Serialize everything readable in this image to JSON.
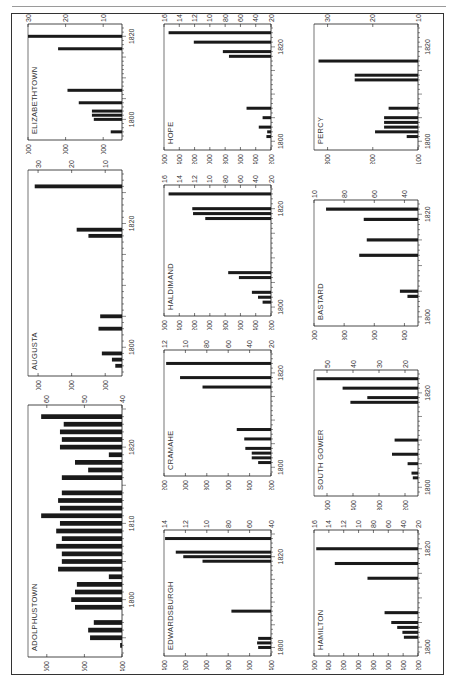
{
  "page": {
    "orientation": "rotated-90",
    "ink_color": "#1a1a1a",
    "paper_color": "#ffffff",
    "frame_color": "#333333"
  },
  "chart_data": [
    {
      "type": "bar",
      "title": "ELIZABETHTOWN",
      "xlabel": "",
      "ylabel": "",
      "x_ticks": [
        "1800",
        "1820"
      ],
      "x_range": [
        1796,
        1822
      ],
      "ylim": [
        500,
        3000
      ],
      "y_ticks": [
        1000,
        2000,
        3000
      ],
      "x": [
        1797,
        1800,
        1801,
        1802,
        1804,
        1807,
        1817,
        1820
      ],
      "values": [
        800,
        1250,
        1300,
        1300,
        1650,
        1950,
        2200,
        3000
      ],
      "panel": {
        "left": 14,
        "top": 14,
        "width": 132,
        "height": 140
      }
    },
    {
      "type": "bar",
      "title": "AUGUSTA",
      "xlabel": "",
      "ylabel": "",
      "x_ticks": [
        "1800",
        "1820"
      ],
      "x_range": [
        1796,
        1828
      ],
      "ylim": [
        500,
        3300
      ],
      "y_ticks": [
        1000,
        2000,
        3000
      ],
      "x": [
        1797,
        1798,
        1799,
        1803,
        1805,
        1818,
        1819,
        1826
      ],
      "values": [
        700,
        800,
        1100,
        1200,
        1150,
        1500,
        1850,
        3100
      ],
      "panel": {
        "left": 14,
        "top": 160,
        "width": 132,
        "height": 230
      }
    },
    {
      "type": "bar",
      "title": "ADOLPHUSTOWN",
      "xlabel": "",
      "ylabel": "",
      "x_ticks": [
        "1800",
        "1810",
        "1820"
      ],
      "x_range": [
        1793,
        1825
      ],
      "ylim": [
        400,
        650
      ],
      "y_ticks": [
        400,
        500,
        600
      ],
      "x": [
        1794,
        1795,
        1796,
        1797,
        1799,
        1800,
        1801,
        1802,
        1803,
        1804,
        1805,
        1806,
        1807,
        1808,
        1809,
        1810,
        1811,
        1812,
        1813,
        1814,
        1816,
        1817,
        1818,
        1819,
        1820,
        1821,
        1822,
        1823,
        1824
      ],
      "values": [
        405,
        485,
        490,
        475,
        525,
        535,
        525,
        520,
        435,
        570,
        560,
        560,
        575,
        560,
        575,
        565,
        615,
        565,
        570,
        560,
        560,
        490,
        525,
        435,
        565,
        560,
        565,
        555,
        615
      ],
      "panel": {
        "left": 14,
        "top": 395,
        "width": 132,
        "height": 276
      }
    },
    {
      "type": "bar",
      "title": "HOPE",
      "xlabel": "",
      "ylabel": "",
      "x_ticks": [
        "1800",
        "1820"
      ],
      "x_range": [
        1799,
        1824
      ],
      "ylim": [
        200,
        1600
      ],
      "y_ticks": [
        200,
        400,
        600,
        800,
        1000,
        1200,
        1400,
        1600
      ],
      "x": [
        1801,
        1802,
        1803,
        1805,
        1807,
        1818,
        1819,
        1821,
        1823
      ],
      "values": [
        260,
        250,
        360,
        310,
        520,
        750,
        830,
        1210,
        1540
      ],
      "panel": {
        "left": 150,
        "top": 14,
        "width": 145,
        "height": 150
      }
    },
    {
      "type": "bar",
      "title": "HALDIMAND",
      "xlabel": "",
      "ylabel": "",
      "x_ticks": [
        "1800",
        "1820"
      ],
      "x_range": [
        1799,
        1824
      ],
      "ylim": [
        200,
        1600
      ],
      "y_ticks": [
        200,
        400,
        600,
        800,
        1000,
        1200,
        1400,
        1600
      ],
      "x": [
        1801,
        1802,
        1803,
        1806,
        1807,
        1818,
        1819,
        1820,
        1823
      ],
      "values": [
        310,
        370,
        450,
        620,
        760,
        1060,
        1220,
        1230,
        1540
      ],
      "panel": {
        "left": 150,
        "top": 175,
        "width": 145,
        "height": 155
      }
    },
    {
      "type": "bar",
      "title": "CRAMAHE",
      "xlabel": "",
      "ylabel": "",
      "x_ticks": [
        "1800",
        "1820"
      ],
      "x_range": [
        1799,
        1824
      ],
      "ylim": [
        200,
        1200
      ],
      "y_ticks": [
        200,
        400,
        600,
        800,
        1000,
        1200
      ],
      "x": [
        1801,
        1802,
        1803,
        1804,
        1806,
        1808,
        1817,
        1819,
        1822
      ],
      "values": [
        320,
        380,
        380,
        440,
        450,
        520,
        840,
        1050,
        1180
      ],
      "panel": {
        "left": 150,
        "top": 340,
        "width": 145,
        "height": 150
      }
    },
    {
      "type": "bar",
      "title": "EDWARDSBURGH",
      "xlabel": "",
      "ylabel": "",
      "x_ticks": [
        "1800",
        "1820"
      ],
      "x_range": [
        1799,
        1825
      ],
      "ylim": [
        400,
        1400
      ],
      "y_ticks": [
        400,
        600,
        800,
        1000,
        1200,
        1400
      ],
      "x": [
        1800,
        1801,
        1802,
        1808,
        1819,
        1820,
        1821,
        1824
      ],
      "values": [
        520,
        530,
        520,
        770,
        1040,
        1220,
        1290,
        1390
      ],
      "panel": {
        "left": 150,
        "top": 520,
        "width": 145,
        "height": 150
      }
    },
    {
      "type": "bar",
      "title": "PERCY",
      "xlabel": "",
      "ylabel": "",
      "x_ticks": [
        "1800",
        "1820"
      ],
      "x_range": [
        1799,
        1824
      ],
      "ylim": [
        100,
        330
      ],
      "y_ticks": [
        100,
        200,
        300
      ],
      "x": [
        1801,
        1802,
        1803,
        1804,
        1805,
        1807,
        1813,
        1814,
        1817
      ],
      "values": [
        125,
        195,
        175,
        175,
        175,
        165,
        240,
        240,
        320
      ],
      "panel": {
        "left": 300,
        "top": 14,
        "width": 142,
        "height": 150
      }
    },
    {
      "type": "bar",
      "title": "BASTARD",
      "xlabel": "",
      "ylabel": "",
      "x_ticks": [
        "1800",
        "1820"
      ],
      "x_range": [
        1799,
        1822
      ],
      "ylim": [
        310,
        1000
      ],
      "y_ticks": [
        400,
        600,
        800,
        1000
      ],
      "x": [
        1804,
        1805,
        1812,
        1815,
        1819,
        1821
      ],
      "values": [
        380,
        430,
        700,
        650,
        670,
        920
      ],
      "panel": {
        "left": 300,
        "top": 190,
        "width": 142,
        "height": 150
      }
    },
    {
      "type": "bar",
      "title": "SOUTH GOWER",
      "xlabel": "",
      "ylabel": "",
      "x_ticks": [
        "1800",
        "1820"
      ],
      "x_range": [
        1799,
        1824
      ],
      "ylim": [
        150,
        550
      ],
      "y_ticks": [
        200,
        300,
        400,
        500
      ],
      "x": [
        1802,
        1803,
        1805,
        1807,
        1810,
        1818,
        1819,
        1821,
        1823
      ],
      "values": [
        170,
        175,
        190,
        250,
        240,
        410,
        345,
        440,
        540
      ],
      "panel": {
        "left": 300,
        "top": 360,
        "width": 142,
        "height": 150
      }
    },
    {
      "type": "bar",
      "title": "HAMILTON",
      "xlabel": "",
      "ylabel": "",
      "x_ticks": [
        "1800",
        "1820"
      ],
      "x_range": [
        1799,
        1823
      ],
      "ylim": [
        200,
        1600
      ],
      "y_ticks": [
        200,
        400,
        600,
        800,
        1000,
        1200,
        1400,
        1600
      ],
      "x": [
        1802,
        1803,
        1804,
        1805,
        1807,
        1814,
        1817,
        1820
      ],
      "values": [
        390,
        410,
        480,
        560,
        650,
        880,
        1320,
        1570
      ],
      "panel": {
        "left": 300,
        "top": 520,
        "width": 142,
        "height": 150
      }
    }
  ]
}
